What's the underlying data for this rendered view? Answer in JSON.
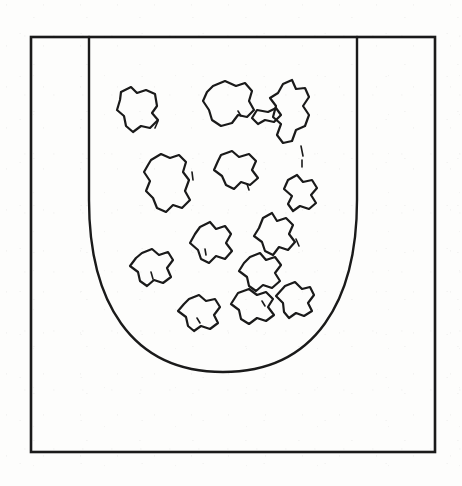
{
  "figure": {
    "title": "Granular material contained in a U-shaped vessel",
    "style": {
      "background_color": "#fdfdfc",
      "ink_color": "#1a1a1a",
      "frame_stroke_width": 2.6,
      "vessel_stroke_width": 2.4,
      "particle_stroke_width": 2.2
    },
    "frame": {
      "name": "outer-border-frame",
      "x": 31,
      "y": 37,
      "width": 404,
      "height": 415
    },
    "vessel": {
      "name": "u-shaped-container",
      "rim_y": 37,
      "left_wall_x": 89,
      "right_wall_x": 357,
      "bottom_y": 372,
      "curve_start_y": 196,
      "path": "M 89 37 L 89 200 C 89 300 130 372 223 372 C 316 372 357 300 357 200 L 357 37"
    },
    "particles": {
      "count": 14,
      "label": "irregular granular particles",
      "paths": [
        "M 121 92 L 131 87 L 137 93 L 146 90 L 155 94 L 157 106 L 152 113 L 158 120 L 150 128 L 141 126 L 133 132 L 126 126 L 124 116 L 117 110 L 120 100 Z",
        "M 213 86 L 225 81 L 236 86 L 245 83 L 252 91 L 249 101 L 254 110 L 247 117 L 238 115 L 232 123 L 221 126 L 212 120 L 209 110 L 203 101 L 207 92 Z",
        "M 283 84 L 292 80 L 296 89 L 305 88 L 309 97 L 303 106 L 309 115 L 305 126 L 296 130 L 292 141 L 283 143 L 277 135 L 281 124 L 273 117 L 276 106 L 270 98 L 278 93 Z",
        "M 257 110 L 268 112 L 276 108 L 281 115 L 274 122 L 265 120 L 258 124 L 252 118 Z",
        "M 151 160 L 161 154 L 170 158 L 179 155 L 186 162 L 183 172 L 189 180 L 185 191 L 190 200 L 182 208 L 173 205 L 166 212 L 157 208 L 153 198 L 146 191 L 150 181 L 144 172 L 148 165 Z",
        "M 221 155 L 232 151 L 239 157 L 249 154 L 256 161 L 252 170 L 258 178 L 250 185 L 241 182 L 234 189 L 226 185 L 222 176 L 214 170 L 218 161 Z",
        "M 288 180 L 297 175 L 303 182 L 312 180 L 317 188 L 311 195 L 316 203 L 309 209 L 300 206 L 293 211 L 288 204 L 292 196 L 284 189 Z",
        "M 263 218 L 272 213 L 277 221 L 286 218 L 293 225 L 289 234 L 295 242 L 288 250 L 279 247 L 273 255 L 265 251 L 262 242 L 254 236 L 259 228 Z",
        "M 200 227 L 210 222 L 216 229 L 225 226 L 231 234 L 226 243 L 232 251 L 225 259 L 216 256 L 209 263 L 201 259 L 198 250 L 190 243 L 195 234 Z",
        "M 142 253 L 152 249 L 159 255 L 168 252 L 173 260 L 167 268 L 171 277 L 163 283 L 154 280 L 147 286 L 140 281 L 138 272 L 130 266 L 136 258 Z",
        "M 250 257 L 260 253 L 266 260 L 275 257 L 281 265 L 275 273 L 280 281 L 272 288 L 263 285 L 256 291 L 249 286 L 247 277 L 239 271 L 244 263 Z",
        "M 189 299 L 199 295 L 206 301 L 215 299 L 220 307 L 214 315 L 218 323 L 210 329 L 201 326 L 194 331 L 188 326 L 186 317 L 178 311 L 184 304 Z",
        "M 238 293 L 249 289 L 257 295 L 266 292 L 273 299 L 268 307 L 274 315 L 266 321 L 257 318 L 249 324 L 241 319 L 239 310 L 231 304 Z",
        "M 285 286 L 295 282 L 302 289 L 310 287 L 314 295 L 308 303 L 312 311 L 304 316 L 296 313 L 289 318 L 284 312 L 283 303 L 276 296 Z"
      ],
      "accent_marks": [
        "M 158 121 L 155 128",
        "M 238 111 L 241 116",
        "M 301 146 L 303 156",
        "M 302 160 L 302 167",
        "M 192 172 L 193 180",
        "M 247 184 L 249 190",
        "M 296 239 L 299 246",
        "M 205 249 L 206 255",
        "M 151 272 L 153 279",
        "M 262 301 L 265 306",
        "M 197 318 L 200 323"
      ]
    }
  }
}
